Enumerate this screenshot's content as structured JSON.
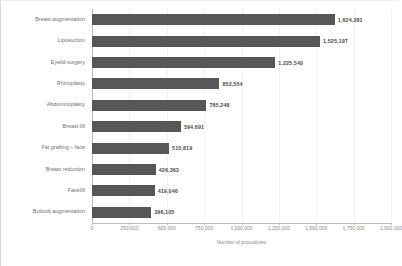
{
  "chart_data": {
    "type": "bar",
    "orientation": "horizontal",
    "title": "",
    "subtitle": "",
    "xlabel": "Number of procedures",
    "ylabel": "",
    "xlim": [
      0,
      2000000
    ],
    "grid": true,
    "legend": null,
    "bar_color": "#575757",
    "label_color": "#4c4c4c",
    "categories": [
      "Breast augmentation",
      "Liposuction",
      "Eyelid surgery",
      "Rhinoplasty",
      "Abdominoplasty",
      "Breast lift",
      "Fat grafting – face",
      "Breast reduction",
      "Facelift",
      "Buttock augmentation"
    ],
    "values": [
      1624281,
      1525197,
      1225540,
      852554,
      765248,
      594691,
      515819,
      426363,
      419046,
      396105
    ],
    "value_labels": [
      "1,624,281",
      "1,525,197",
      "1,225,540",
      "852,554",
      "765,248",
      "594,691",
      "515,819",
      "426,363",
      "419,046",
      "396,105"
    ],
    "xticks": [
      0,
      250000,
      500000,
      750000,
      1000000,
      1250000,
      1500000,
      1750000,
      2000000
    ],
    "xtick_labels": [
      "0",
      "250,000",
      "500,000",
      "750,000",
      "1,000,000",
      "1,250,000",
      "1,500,000",
      "1,750,000",
      "2,000,000"
    ]
  }
}
